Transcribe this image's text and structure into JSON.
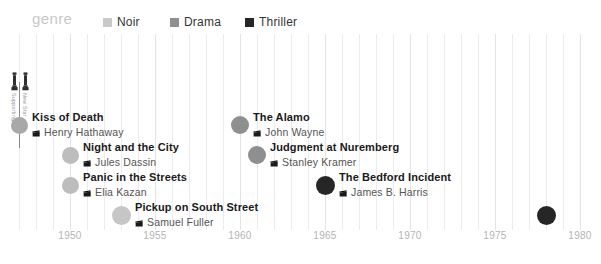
{
  "legend": {
    "title": "genre",
    "items": [
      {
        "label": "Noir",
        "color": "#c9c9c9"
      },
      {
        "label": "Drama",
        "color": "#8f8f8f"
      },
      {
        "label": "Thriller",
        "color": "#262626"
      }
    ]
  },
  "axis": {
    "ticks": [
      "1950",
      "1955",
      "1960",
      "1965",
      "1970",
      "1975",
      "1980"
    ],
    "tick_values": [
      1950,
      1955,
      1960,
      1965,
      1970,
      1975,
      1980
    ]
  },
  "annotations": {
    "oscar_icon_name": "oscar-statuette-icon",
    "labels": [
      "Supporting",
      "New Star"
    ]
  },
  "chart_data": {
    "type": "scatter",
    "title": "genre",
    "xlabel": "",
    "ylabel": "",
    "xlim": [
      1946,
      1981
    ],
    "grid": true,
    "legend_position": "top",
    "legend_entries": [
      "Noir",
      "Drama",
      "Thriller"
    ],
    "xticks": [
      1950,
      1955,
      1960,
      1965,
      1970,
      1975,
      1980
    ],
    "points": [
      {
        "title": "Kiss of Death",
        "director": "Henry Hathaway",
        "year": 1947,
        "genre": "Noir",
        "color": "#a8a8a8",
        "size": 17,
        "label_side": "right",
        "row": 0,
        "awards": [
          "Supporting",
          "New Star"
        ]
      },
      {
        "title": "Night and the City",
        "director": "Jules Dassin",
        "year": 1950,
        "genre": "Noir",
        "color": "#bdbdbd",
        "size": 17,
        "label_side": "right",
        "row": 1,
        "awards": []
      },
      {
        "title": "Panic in the Streets",
        "director": "Elia Kazan",
        "year": 1950,
        "genre": "Noir",
        "color": "#bdbdbd",
        "size": 17,
        "label_side": "right",
        "row": 2,
        "awards": []
      },
      {
        "title": "Pickup on South Street",
        "director": "Samuel Fuller",
        "year": 1953,
        "genre": "Noir",
        "color": "#c6c6c6",
        "size": 19,
        "label_side": "right",
        "row": 3,
        "awards": []
      },
      {
        "title": "The Alamo",
        "director": "John Wayne",
        "year": 1960,
        "genre": "Drama",
        "color": "#8f8f8f",
        "size": 18,
        "label_side": "right",
        "row": 0,
        "awards": []
      },
      {
        "title": "Judgment at Nuremberg",
        "director": "Stanley Kramer",
        "year": 1961,
        "genre": "Drama",
        "color": "#8f8f8f",
        "size": 18,
        "label_side": "right",
        "row": 1,
        "awards": []
      },
      {
        "title": "The Bedford Incident",
        "director": "James B. Harris",
        "year": 1965,
        "genre": "Thriller",
        "color": "#262626",
        "size": 19,
        "label_side": "right",
        "row": 2,
        "awards": []
      },
      {
        "title": "Coma",
        "director": "Michael Crichton",
        "year": 1978,
        "genre": "Thriller",
        "color": "#262626",
        "size": 19,
        "label_side": "left",
        "row": 3,
        "awards": []
      }
    ]
  }
}
